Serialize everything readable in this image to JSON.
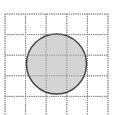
{
  "diagram": {
    "type": "grid-with-circle",
    "grid": {
      "rows": 5,
      "cols": 5,
      "x": 5,
      "y": 14,
      "cell": 20.6,
      "line_color": "#8a8a8a",
      "line_style": "dotted"
    },
    "circle": {
      "cx": 56.5,
      "cy": 64,
      "r": 30,
      "fill": "#d4d4d4",
      "stroke": "#444444"
    },
    "background": "#ffffff"
  }
}
